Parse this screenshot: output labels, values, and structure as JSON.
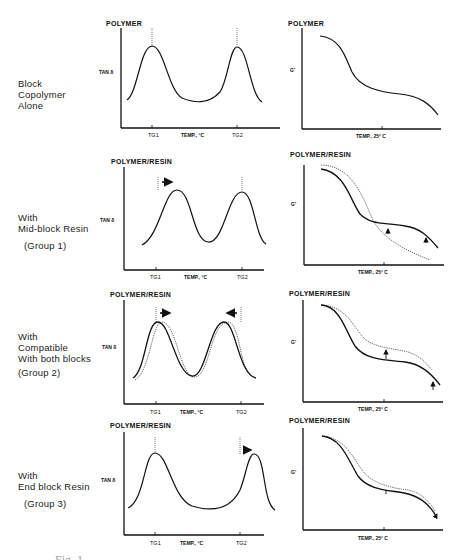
{
  "figure": {
    "caption_fragment": "Fig. 1",
    "rows": [
      {
        "label_lines": [
          "Block",
          "Copolymer",
          "Alone"
        ],
        "group": "",
        "left_plot": {
          "title": "POLYMER",
          "ylabel": "TAN δ",
          "xlabel": "TEMP., °C",
          "tick1": "TG1",
          "tick2": "TG2"
        },
        "right_plot": {
          "title": "POLYMER",
          "ylabel": "G'",
          "xlabel": "TEMP., 25° C"
        }
      },
      {
        "label_lines": [
          "With",
          "Mid-block Resin"
        ],
        "group": "(Group 1)",
        "left_plot": {
          "title": "POLYMER/RESIN",
          "ylabel": "TAN δ",
          "xlabel": "TEMP., °C",
          "tick1": "TG1",
          "tick2": "TG2"
        },
        "right_plot": {
          "title": "POLYMER/RESIN",
          "ylabel": "G'",
          "xlabel": "TEMP., 25° C"
        }
      },
      {
        "label_lines": [
          "With",
          "Compatible",
          "With both blocks"
        ],
        "group": "(Group 2)",
        "left_plot": {
          "title": "POLYMER/RESIN",
          "ylabel": "TAN δ",
          "xlabel": "TEMP., °C",
          "tick1": "TG1",
          "tick2": "TG2"
        },
        "right_plot": {
          "title": "POLYMER/RESIN",
          "ylabel": "G'",
          "xlabel": "TEMP., 25° C"
        }
      },
      {
        "label_lines": [
          "With",
          "End block Resin"
        ],
        "group": "(Group 3)",
        "left_plot": {
          "title": "POLYMER/RESIN",
          "ylabel": "TAN δ",
          "xlabel": "TEMP., °C",
          "tick1": "TG1",
          "tick2": "TG2"
        },
        "right_plot": {
          "title": "POLYMER/RESIN",
          "ylabel": "G'",
          "xlabel": "TEMP., 25° C"
        }
      }
    ]
  },
  "colors": {
    "ink": "#111111",
    "dotted": "#555555",
    "background": "#ffffff"
  }
}
